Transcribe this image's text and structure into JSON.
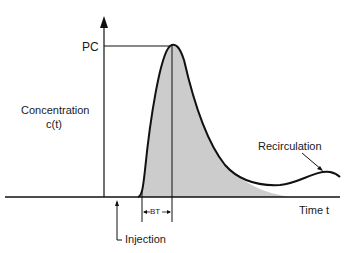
{
  "diagram": {
    "labels": {
      "peak": "PC",
      "y_axis_line1": "Concentration",
      "y_axis_line2": "c(t)",
      "x_axis": "Time t",
      "recirculation": "Recirculation",
      "injection": "Injection",
      "bolus_time": "BT"
    },
    "colors": {
      "curve": "#111111",
      "fill": "#cccccc",
      "background": "#ffffff"
    }
  }
}
